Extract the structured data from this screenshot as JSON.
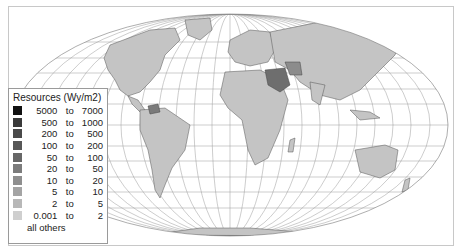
{
  "legend": {
    "title": "Resources (Wy/m2)",
    "classes": [
      {
        "lo": "5000",
        "to": "to",
        "hi": "7000",
        "color": "#111111"
      },
      {
        "lo": "500",
        "to": "to",
        "hi": "1000",
        "color": "#3a3a3a"
      },
      {
        "lo": "200",
        "to": "to",
        "hi": "500",
        "color": "#4a4a4a"
      },
      {
        "lo": "100",
        "to": "to",
        "hi": "200",
        "color": "#575757"
      },
      {
        "lo": "50",
        "to": "to",
        "hi": "100",
        "color": "#676767"
      },
      {
        "lo": "20",
        "to": "to",
        "hi": "50",
        "color": "#7c7c7c"
      },
      {
        "lo": "10",
        "to": "to",
        "hi": "20",
        "color": "#8f8f8f"
      },
      {
        "lo": "5",
        "to": "to",
        "hi": "10",
        "color": "#a4a4a4"
      },
      {
        "lo": "2",
        "to": "to",
        "hi": "5",
        "color": "#b8b8b8"
      },
      {
        "lo": "0.001",
        "to": "to",
        "hi": "2",
        "color": "#cfcfcf"
      }
    ],
    "others_label": "all others"
  },
  "map": {
    "projection": "Mollweide-like world map with graticule",
    "land_default_color": "#c4c4c4",
    "highlight_colors": {
      "saudi_arabia": "#6e6e6e",
      "iran": "#8c8c8c",
      "venezuela": "#7a7a7a"
    }
  }
}
